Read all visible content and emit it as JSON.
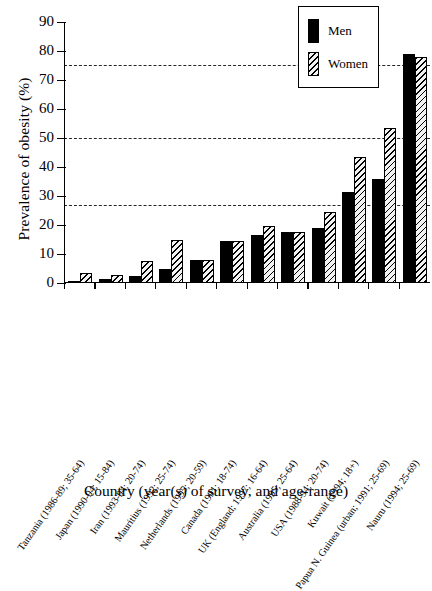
{
  "chart_data": {
    "type": "bar",
    "title": "",
    "xlabel": "Country (year(s) of survey, and age-range)",
    "ylabel": "Prevalence of obesity (%)",
    "ylim": [
      0,
      90
    ],
    "ytick_labels": [
      "0",
      "10",
      "20",
      "30",
      "40",
      "50",
      "60",
      "70",
      "80",
      "90"
    ],
    "ytick_values": [
      0,
      10,
      20,
      30,
      40,
      50,
      60,
      70,
      80,
      90
    ],
    "grid": false,
    "reference_lines": [
      75,
      49.5,
      26.5
    ],
    "legend_position": "top-right",
    "categories": [
      "Tanzania (1986-89; 35-64)",
      "Japan (1990-94; 15-84)",
      "Iran (1993-94; 20-74)",
      "Mauritius (1992; 25-74)",
      "Netherlands (1995; 20-59)",
      "Canada (1991; 18-74)",
      "UK (England; 1997; 16-64)",
      "Australia (1995; 25-64)",
      "USA (1988-94; 20-74)",
      "Kuwait (1994; 18+)",
      "Papua N. Guinea (urban; 1991; 25-69)",
      "Nauru (1994; 25-69)"
    ],
    "series": [
      {
        "name": "Men",
        "color": "#000000",
        "fill": "solid",
        "values": [
          0.4,
          1.5,
          2.5,
          5.0,
          8.0,
          14.6,
          16.5,
          17.5,
          19.0,
          31.5,
          36.0,
          79.0
        ]
      },
      {
        "name": "Women",
        "color": "#000000",
        "fill": "hatched",
        "values": [
          3.6,
          2.6,
          7.7,
          15.0,
          8.1,
          14.5,
          19.5,
          17.5,
          24.5,
          43.5,
          53.5,
          78.0
        ]
      }
    ]
  },
  "legend": {
    "items": [
      {
        "label": "Men"
      },
      {
        "label": "Women"
      }
    ]
  }
}
